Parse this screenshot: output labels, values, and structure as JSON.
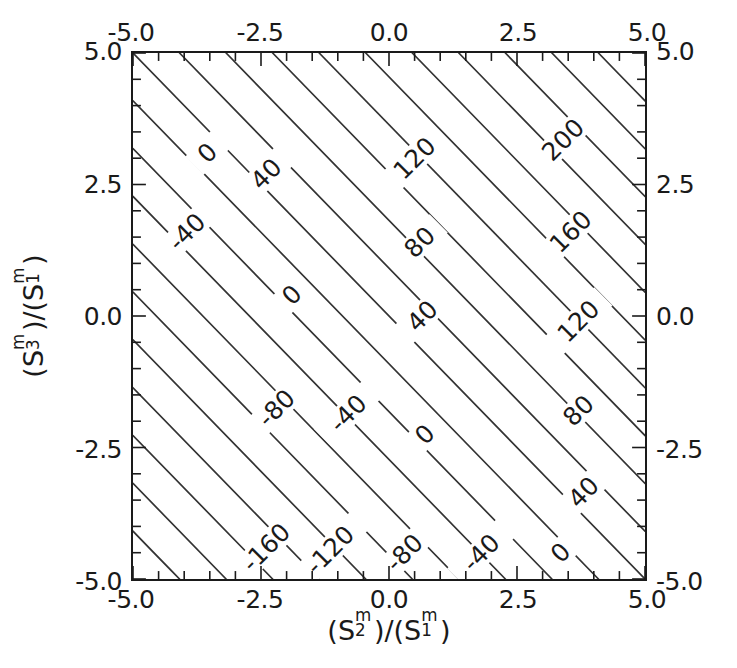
{
  "figure": {
    "background": "#ffffff",
    "line_color": "#333333",
    "text_color": "#1a1a1a",
    "width": 737,
    "height": 668
  },
  "axes": {
    "x_title_parts": {
      "open1": "(",
      "S": "S",
      "sub": "2",
      "sup": "m",
      "close1": ")",
      "slash": "/",
      "open2": "(",
      "S2": "S",
      "sub2": "1",
      "sup2": "m",
      "close2": ")"
    },
    "y_title_parts": {
      "open1": "(",
      "S": "S",
      "sub": "3",
      "sup": "m",
      "close1": ")",
      "slash": "/",
      "open2": "(",
      "S2": "S",
      "sub2": "1",
      "sup2": "m",
      "close2": ")"
    },
    "x_title": "(S2m)/(S1m)",
    "y_title": "(S3m)/(S1m)",
    "top_ticks": [
      "-5.0",
      "-2.5",
      "0.0",
      "2.5",
      "5.0"
    ],
    "bottom_ticks": [
      "-5.0",
      "-2.5",
      "0.0",
      "2.5",
      "5.0"
    ],
    "left_ticks": [
      "5.0",
      "2.5",
      "0.0",
      "-2.5",
      "-5.0"
    ],
    "right_ticks": [
      "5.0",
      "2.5",
      "0.0",
      "-2.5",
      "-5.0"
    ]
  },
  "chart_data": {
    "type": "contour",
    "title": "",
    "xlabel": "(S₂ᵐ)/(S₁ᵐ)",
    "ylabel": "(S₃ᵐ)/(S₁ᵐ)",
    "xlim": [
      -5.0,
      5.0
    ],
    "ylim": [
      -5.0,
      5.0
    ],
    "xticks": [
      -5.0,
      -2.5,
      0.0,
      2.5,
      5.0
    ],
    "yticks": [
      -5.0,
      -2.5,
      0.0,
      2.5,
      5.0
    ],
    "xticklabels": [
      "-5.0",
      "-2.5",
      "0.0",
      "2.5",
      "5.0"
    ],
    "yticklabels": [
      "-5.0",
      "-2.5",
      "0.0",
      "2.5",
      "5.0"
    ],
    "minor_tick_interval": 0.5,
    "ticks_direction": "in",
    "ticks_all_sides": true,
    "grid": false,
    "legend": false,
    "colorbar": false,
    "contour_interval": 20,
    "label_interval": 40,
    "contour_levels": [
      -220,
      -200,
      -180,
      -160,
      -140,
      -120,
      -100,
      -80,
      -60,
      -40,
      -20,
      0,
      20,
      40,
      60,
      80,
      100,
      120,
      140,
      160,
      180,
      200,
      220
    ],
    "labeled_levels": [
      -200,
      -160,
      -120,
      -80,
      -40,
      0,
      40,
      80,
      120,
      160,
      200
    ],
    "surface_model": "z = 22*(x + y)",
    "z_range_corners": {
      "bottom_left": -220,
      "bottom_right": 0,
      "top_left": 0,
      "top_right": 220
    },
    "contour_orientation": "Parallel straight lines of slope -1 in data space; value increases toward upper-right.",
    "inline_labels": [
      {
        "value": "0",
        "x": -3.55,
        "y": 3.1
      },
      {
        "value": "40",
        "x": -2.4,
        "y": 2.7
      },
      {
        "value": "120",
        "x": 0.5,
        "y": 3.0
      },
      {
        "value": "200",
        "x": 3.4,
        "y": 3.35
      },
      {
        "value": "-40",
        "x": -3.95,
        "y": 1.6
      },
      {
        "value": "80",
        "x": 0.6,
        "y": 1.4
      },
      {
        "value": "160",
        "x": 3.55,
        "y": 1.6
      },
      {
        "value": "0",
        "x": -1.9,
        "y": 0.4
      },
      {
        "value": "40",
        "x": 0.65,
        "y": 0.0
      },
      {
        "value": "120",
        "x": 3.7,
        "y": -0.1
      },
      {
        "value": "-80",
        "x": -2.2,
        "y": -1.75
      },
      {
        "value": "-40",
        "x": -0.8,
        "y": -1.85
      },
      {
        "value": "0",
        "x": 0.7,
        "y": -2.25
      },
      {
        "value": "80",
        "x": 3.7,
        "y": -1.8
      },
      {
        "value": "40",
        "x": 3.8,
        "y": -3.35
      },
      {
        "value": "-160",
        "x": -2.4,
        "y": -4.4
      },
      {
        "value": "-120",
        "x": -1.15,
        "y": -4.45
      },
      {
        "value": "-80",
        "x": 0.3,
        "y": -4.5
      },
      {
        "value": "-40",
        "x": 1.8,
        "y": -4.5
      },
      {
        "value": "0",
        "x": 3.35,
        "y": -4.5
      }
    ]
  }
}
